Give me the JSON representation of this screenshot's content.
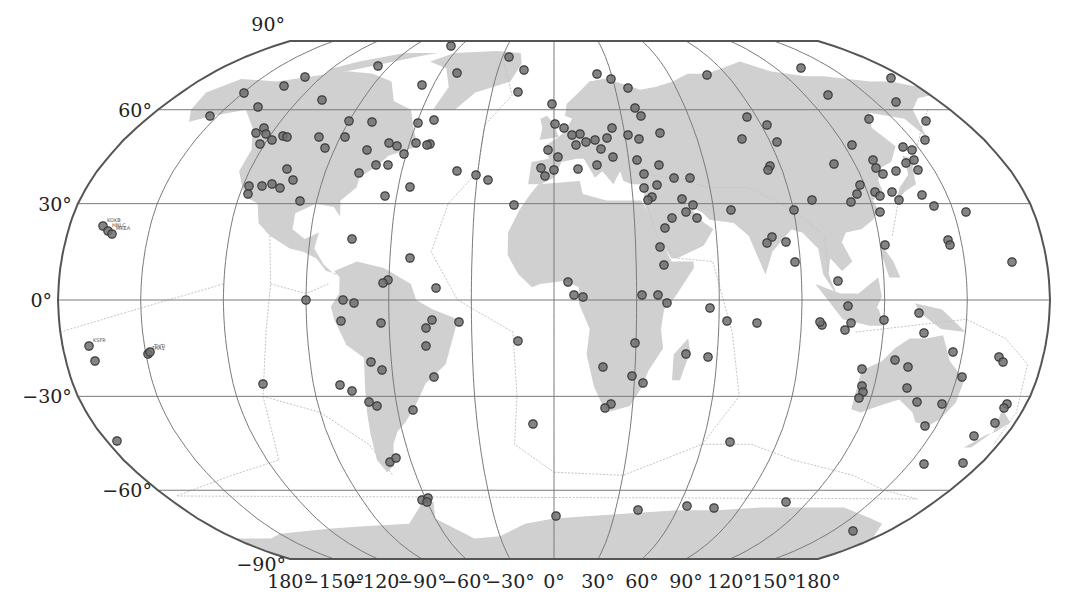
{
  "figure": {
    "projection": "Robinson",
    "colors": {
      "ocean": "#ffffff",
      "land": "#d0d0d0",
      "graticule": "#7a7a7a",
      "outline": "#555555",
      "plate_boundary": "#c4c4c4",
      "station_fill": "#6e6e6e",
      "station_stroke": "#3a3a3a",
      "text": "#222222"
    },
    "latitude_labels": [
      {
        "text": "90°",
        "lat": 90
      },
      {
        "text": "60°",
        "lat": 60
      },
      {
        "text": "30°",
        "lat": 30
      },
      {
        "text": "0°",
        "lat": 0
      },
      {
        "text": "−30°",
        "lat": -30
      },
      {
        "text": "−60°",
        "lat": -60
      },
      {
        "text": "−90°",
        "lat": -90
      }
    ],
    "longitude_labels": [
      {
        "text": "180°",
        "lon": -180
      },
      {
        "text": "−150°",
        "lon": -150
      },
      {
        "text": "−120°",
        "lon": -120
      },
      {
        "text": "−90°",
        "lon": -90
      },
      {
        "text": "−60°",
        "lon": -60
      },
      {
        "text": "−30°",
        "lon": -30
      },
      {
        "text": "0°",
        "lon": 0
      },
      {
        "text": "30°",
        "lon": 30
      },
      {
        "text": "60°",
        "lon": 60
      },
      {
        "text": "90°",
        "lon": 90
      },
      {
        "text": "120°",
        "lon": 120
      },
      {
        "text": "150°",
        "lon": 150
      },
      {
        "text": "180°",
        "lon": 180
      }
    ],
    "stations": [
      {
        "label": "KOKB",
        "x": 103,
        "y": 226
      },
      {
        "label": "HNLC",
        "x": 108,
        "y": 231
      },
      {
        "label": "MKEA",
        "x": 112,
        "y": 234
      },
      {
        "label": "KSFR",
        "x": 89,
        "y": 346
      },
      {
        "label": "FAA1",
        "x": 148,
        "y": 354
      },
      {
        "label": "THTI",
        "x": 150,
        "y": 352
      },
      {
        "label": "",
        "x": 95,
        "y": 361
      },
      {
        "label": "",
        "x": 117,
        "y": 441
      },
      {
        "label": "",
        "x": 263,
        "y": 384
      },
      {
        "label": "",
        "x": 210,
        "y": 116
      },
      {
        "label": "",
        "x": 244,
        "y": 93
      },
      {
        "label": "",
        "x": 258,
        "y": 107
      },
      {
        "label": "",
        "x": 284,
        "y": 86
      },
      {
        "label": "",
        "x": 305,
        "y": 77
      },
      {
        "label": "",
        "x": 322,
        "y": 100
      },
      {
        "label": "",
        "x": 378,
        "y": 66
      },
      {
        "label": "",
        "x": 422,
        "y": 85
      },
      {
        "label": "",
        "x": 451,
        "y": 46
      },
      {
        "label": "",
        "x": 457,
        "y": 73
      },
      {
        "label": "",
        "x": 418,
        "y": 123
      },
      {
        "label": "",
        "x": 434,
        "y": 120
      },
      {
        "label": "",
        "x": 372,
        "y": 122
      },
      {
        "label": "",
        "x": 349,
        "y": 121
      },
      {
        "label": "",
        "x": 264,
        "y": 128
      },
      {
        "label": "",
        "x": 256,
        "y": 133
      },
      {
        "label": "",
        "x": 266,
        "y": 134
      },
      {
        "label": "",
        "x": 260,
        "y": 144
      },
      {
        "label": "",
        "x": 272,
        "y": 140
      },
      {
        "label": "",
        "x": 283,
        "y": 136
      },
      {
        "label": "",
        "x": 287,
        "y": 137
      },
      {
        "label": "",
        "x": 319,
        "y": 137
      },
      {
        "label": "",
        "x": 345,
        "y": 137
      },
      {
        "label": "",
        "x": 325,
        "y": 148
      },
      {
        "label": "",
        "x": 367,
        "y": 150
      },
      {
        "label": "",
        "x": 389,
        "y": 143
      },
      {
        "label": "",
        "x": 397,
        "y": 146
      },
      {
        "label": "",
        "x": 404,
        "y": 154
      },
      {
        "label": "",
        "x": 416,
        "y": 143
      },
      {
        "label": "",
        "x": 430,
        "y": 144
      },
      {
        "label": "",
        "x": 427,
        "y": 145
      },
      {
        "label": "",
        "x": 388,
        "y": 165
      },
      {
        "label": "",
        "x": 376,
        "y": 165
      },
      {
        "label": "",
        "x": 359,
        "y": 173
      },
      {
        "label": "",
        "x": 287,
        "y": 169
      },
      {
        "label": "",
        "x": 293,
        "y": 180
      },
      {
        "label": "",
        "x": 249,
        "y": 186
      },
      {
        "label": "",
        "x": 262,
        "y": 186
      },
      {
        "label": "",
        "x": 272,
        "y": 184
      },
      {
        "label": "",
        "x": 248,
        "y": 194
      },
      {
        "label": "",
        "x": 280,
        "y": 188
      },
      {
        "label": "",
        "x": 300,
        "y": 201
      },
      {
        "label": "",
        "x": 385,
        "y": 196
      },
      {
        "label": "",
        "x": 410,
        "y": 187
      },
      {
        "label": "",
        "x": 457,
        "y": 171
      },
      {
        "label": "",
        "x": 476,
        "y": 175
      },
      {
        "label": "",
        "x": 488,
        "y": 180
      },
      {
        "label": "",
        "x": 514,
        "y": 205
      },
      {
        "label": "",
        "x": 352,
        "y": 239
      },
      {
        "label": "",
        "x": 410,
        "y": 258
      },
      {
        "label": "",
        "x": 388,
        "y": 280
      },
      {
        "label": "",
        "x": 383,
        "y": 283
      },
      {
        "label": "",
        "x": 436,
        "y": 288
      },
      {
        "label": "",
        "x": 343,
        "y": 300
      },
      {
        "label": "",
        "x": 354,
        "y": 303
      },
      {
        "label": "",
        "x": 306,
        "y": 300
      },
      {
        "label": "",
        "x": 341,
        "y": 321
      },
      {
        "label": "",
        "x": 381,
        "y": 323
      },
      {
        "label": "",
        "x": 426,
        "y": 328
      },
      {
        "label": "",
        "x": 432,
        "y": 320
      },
      {
        "label": "",
        "x": 459,
        "y": 322
      },
      {
        "label": "",
        "x": 426,
        "y": 346
      },
      {
        "label": "",
        "x": 371,
        "y": 362
      },
      {
        "label": "",
        "x": 382,
        "y": 370
      },
      {
        "label": "",
        "x": 434,
        "y": 377
      },
      {
        "label": "",
        "x": 340,
        "y": 385
      },
      {
        "label": "",
        "x": 352,
        "y": 391
      },
      {
        "label": "",
        "x": 369,
        "y": 402
      },
      {
        "label": "",
        "x": 377,
        "y": 406
      },
      {
        "label": "",
        "x": 413,
        "y": 410
      },
      {
        "label": "",
        "x": 518,
        "y": 341
      },
      {
        "label": "",
        "x": 533,
        "y": 424
      },
      {
        "label": "",
        "x": 390,
        "y": 462
      },
      {
        "label": "",
        "x": 396,
        "y": 458
      },
      {
        "label": "",
        "x": 422,
        "y": 500
      },
      {
        "label": "",
        "x": 428,
        "y": 498
      },
      {
        "label": "",
        "x": 427,
        "y": 502
      },
      {
        "label": "",
        "x": 556,
        "y": 516
      },
      {
        "label": "",
        "x": 509,
        "y": 57
      },
      {
        "label": "",
        "x": 524,
        "y": 70
      },
      {
        "label": "",
        "x": 518,
        "y": 92
      },
      {
        "label": "",
        "x": 552,
        "y": 104
      },
      {
        "label": "",
        "x": 597,
        "y": 74
      },
      {
        "label": "",
        "x": 611,
        "y": 79
      },
      {
        "label": "",
        "x": 628,
        "y": 88
      },
      {
        "label": "",
        "x": 635,
        "y": 108
      },
      {
        "label": "",
        "x": 641,
        "y": 116
      },
      {
        "label": "",
        "x": 555,
        "y": 124
      },
      {
        "label": "",
        "x": 564,
        "y": 128
      },
      {
        "label": "",
        "x": 580,
        "y": 134
      },
      {
        "label": "",
        "x": 572,
        "y": 135
      },
      {
        "label": "",
        "x": 576,
        "y": 145
      },
      {
        "label": "",
        "x": 586,
        "y": 142
      },
      {
        "label": "",
        "x": 595,
        "y": 140
      },
      {
        "label": "",
        "x": 601,
        "y": 149
      },
      {
        "label": "",
        "x": 607,
        "y": 138
      },
      {
        "label": "",
        "x": 612,
        "y": 128
      },
      {
        "label": "",
        "x": 628,
        "y": 135
      },
      {
        "label": "",
        "x": 639,
        "y": 139
      },
      {
        "label": "",
        "x": 660,
        "y": 133
      },
      {
        "label": "",
        "x": 548,
        "y": 150
      },
      {
        "label": "",
        "x": 558,
        "y": 157
      },
      {
        "label": "",
        "x": 541,
        "y": 168
      },
      {
        "label": "",
        "x": 554,
        "y": 170
      },
      {
        "label": "",
        "x": 545,
        "y": 176
      },
      {
        "label": "",
        "x": 578,
        "y": 169
      },
      {
        "label": "",
        "x": 597,
        "y": 165
      },
      {
        "label": "",
        "x": 613,
        "y": 157
      },
      {
        "label": "",
        "x": 637,
        "y": 160
      },
      {
        "label": "",
        "x": 644,
        "y": 174
      },
      {
        "label": "",
        "x": 659,
        "y": 165
      },
      {
        "label": "",
        "x": 674,
        "y": 178
      },
      {
        "label": "",
        "x": 657,
        "y": 185
      },
      {
        "label": "",
        "x": 690,
        "y": 178
      },
      {
        "label": "",
        "x": 644,
        "y": 188
      },
      {
        "label": "",
        "x": 652,
        "y": 197
      },
      {
        "label": "",
        "x": 648,
        "y": 200
      },
      {
        "label": "",
        "x": 682,
        "y": 199
      },
      {
        "label": "",
        "x": 672,
        "y": 218
      },
      {
        "label": "",
        "x": 665,
        "y": 228
      },
      {
        "label": "",
        "x": 693,
        "y": 205
      },
      {
        "label": "",
        "x": 686,
        "y": 212
      },
      {
        "label": "",
        "x": 697,
        "y": 218
      },
      {
        "label": "",
        "x": 660,
        "y": 247
      },
      {
        "label": "",
        "x": 664,
        "y": 265
      },
      {
        "label": "",
        "x": 574,
        "y": 295
      },
      {
        "label": "",
        "x": 583,
        "y": 297
      },
      {
        "label": "",
        "x": 568,
        "y": 282
      },
      {
        "label": "",
        "x": 642,
        "y": 295
      },
      {
        "label": "",
        "x": 658,
        "y": 295
      },
      {
        "label": "",
        "x": 667,
        "y": 303
      },
      {
        "label": "",
        "x": 635,
        "y": 343
      },
      {
        "label": "",
        "x": 603,
        "y": 367
      },
      {
        "label": "",
        "x": 632,
        "y": 376
      },
      {
        "label": "",
        "x": 643,
        "y": 383
      },
      {
        "label": "",
        "x": 611,
        "y": 404
      },
      {
        "label": "",
        "x": 605,
        "y": 408
      },
      {
        "label": "",
        "x": 686,
        "y": 354
      },
      {
        "label": "",
        "x": 708,
        "y": 357
      },
      {
        "label": "",
        "x": 710,
        "y": 308
      },
      {
        "label": "",
        "x": 731,
        "y": 210
      },
      {
        "label": "",
        "x": 707,
        "y": 75
      },
      {
        "label": "",
        "x": 747,
        "y": 117
      },
      {
        "label": "",
        "x": 742,
        "y": 139
      },
      {
        "label": "",
        "x": 767,
        "y": 125
      },
      {
        "label": "",
        "x": 777,
        "y": 142
      },
      {
        "label": "",
        "x": 770,
        "y": 166
      },
      {
        "label": "",
        "x": 768,
        "y": 170
      },
      {
        "label": "",
        "x": 801,
        "y": 68
      },
      {
        "label": "",
        "x": 828,
        "y": 95
      },
      {
        "label": "",
        "x": 869,
        "y": 119
      },
      {
        "label": "",
        "x": 896,
        "y": 102
      },
      {
        "label": "",
        "x": 891,
        "y": 78
      },
      {
        "label": "",
        "x": 926,
        "y": 121
      },
      {
        "label": "",
        "x": 834,
        "y": 164
      },
      {
        "label": "",
        "x": 852,
        "y": 145
      },
      {
        "label": "",
        "x": 860,
        "y": 185
      },
      {
        "label": "",
        "x": 873,
        "y": 160
      },
      {
        "label": "",
        "x": 876,
        "y": 168
      },
      {
        "label": "",
        "x": 883,
        "y": 174
      },
      {
        "label": "",
        "x": 857,
        "y": 194
      },
      {
        "label": "",
        "x": 851,
        "y": 202
      },
      {
        "label": "",
        "x": 875,
        "y": 192
      },
      {
        "label": "",
        "x": 880,
        "y": 196
      },
      {
        "label": "",
        "x": 892,
        "y": 192
      },
      {
        "label": "",
        "x": 896,
        "y": 171
      },
      {
        "label": "",
        "x": 906,
        "y": 163
      },
      {
        "label": "",
        "x": 912,
        "y": 150
      },
      {
        "label": "",
        "x": 914,
        "y": 160
      },
      {
        "label": "",
        "x": 918,
        "y": 170
      },
      {
        "label": "",
        "x": 903,
        "y": 147
      },
      {
        "label": "",
        "x": 925,
        "y": 140
      },
      {
        "label": "",
        "x": 899,
        "y": 200
      },
      {
        "label": "",
        "x": 922,
        "y": 195
      },
      {
        "label": "",
        "x": 880,
        "y": 212
      },
      {
        "label": "",
        "x": 885,
        "y": 245
      },
      {
        "label": "",
        "x": 934,
        "y": 206
      },
      {
        "label": "",
        "x": 966,
        "y": 212
      },
      {
        "label": "",
        "x": 948,
        "y": 240
      },
      {
        "label": "",
        "x": 950,
        "y": 245
      },
      {
        "label": "",
        "x": 1012,
        "y": 262
      },
      {
        "label": "",
        "x": 794,
        "y": 210
      },
      {
        "label": "",
        "x": 812,
        "y": 200
      },
      {
        "label": "",
        "x": 786,
        "y": 242
      },
      {
        "label": "",
        "x": 772,
        "y": 237
      },
      {
        "label": "",
        "x": 767,
        "y": 243
      },
      {
        "label": "",
        "x": 795,
        "y": 262
      },
      {
        "label": "",
        "x": 848,
        "y": 306
      },
      {
        "label": "",
        "x": 838,
        "y": 281
      },
      {
        "label": "",
        "x": 851,
        "y": 323
      },
      {
        "label": "",
        "x": 845,
        "y": 330
      },
      {
        "label": "",
        "x": 822,
        "y": 325
      },
      {
        "label": "",
        "x": 884,
        "y": 320
      },
      {
        "label": "",
        "x": 919,
        "y": 313
      },
      {
        "label": "",
        "x": 924,
        "y": 333
      },
      {
        "label": "",
        "x": 953,
        "y": 352
      },
      {
        "label": "",
        "x": 895,
        "y": 360
      },
      {
        "label": "",
        "x": 908,
        "y": 367
      },
      {
        "label": "",
        "x": 962,
        "y": 377
      },
      {
        "label": "",
        "x": 862,
        "y": 369
      },
      {
        "label": "",
        "x": 862,
        "y": 386
      },
      {
        "label": "",
        "x": 863,
        "y": 392
      },
      {
        "label": "",
        "x": 859,
        "y": 398
      },
      {
        "label": "",
        "x": 907,
        "y": 388
      },
      {
        "label": "",
        "x": 917,
        "y": 402
      },
      {
        "label": "",
        "x": 942,
        "y": 404
      },
      {
        "label": "",
        "x": 925,
        "y": 426
      },
      {
        "label": "",
        "x": 924,
        "y": 464
      },
      {
        "label": "",
        "x": 999,
        "y": 357
      },
      {
        "label": "",
        "x": 1003,
        "y": 362
      },
      {
        "label": "",
        "x": 1007,
        "y": 404
      },
      {
        "label": "",
        "x": 1004,
        "y": 408
      },
      {
        "label": "",
        "x": 995,
        "y": 423
      },
      {
        "label": "",
        "x": 974,
        "y": 436
      },
      {
        "label": "",
        "x": 963,
        "y": 463
      },
      {
        "label": "",
        "x": 730,
        "y": 442
      },
      {
        "label": "",
        "x": 820,
        "y": 322
      },
      {
        "label": "",
        "x": 757,
        "y": 323
      },
      {
        "label": "",
        "x": 638,
        "y": 510
      },
      {
        "label": "",
        "x": 687,
        "y": 506
      },
      {
        "label": "",
        "x": 714,
        "y": 508
      },
      {
        "label": "",
        "x": 786,
        "y": 502
      },
      {
        "label": "",
        "x": 853,
        "y": 531
      },
      {
        "label": "",
        "x": 727,
        "y": 321
      }
    ]
  }
}
